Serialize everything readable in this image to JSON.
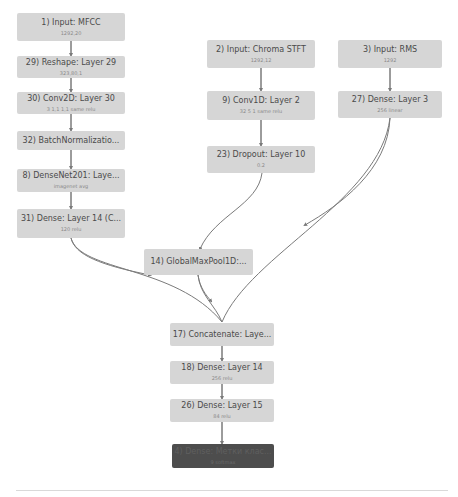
{
  "diagram": {
    "type": "neural-network-architecture",
    "nodes": [
      {
        "id": "n1",
        "title": "1) Input: MFCC",
        "sub": "1292,20"
      },
      {
        "id": "n29",
        "title": "29) Reshape: Layer 29",
        "sub": "323,80,1"
      },
      {
        "id": "n30",
        "title": "30) Conv2D: Layer 30",
        "sub": "3  1,1  1,1  same  relu"
      },
      {
        "id": "n32",
        "title": "32) BatchNormalizatio...",
        "sub": ""
      },
      {
        "id": "n8",
        "title": "8) DenseNet201: Laye...",
        "sub": "imagenet  avg"
      },
      {
        "id": "n31",
        "title": "31) Dense: Layer 14 (C...",
        "sub": "120  relu"
      },
      {
        "id": "n2",
        "title": "2) Input: Chroma STFT",
        "sub": "1292,12"
      },
      {
        "id": "n9",
        "title": "9) Conv1D: Layer 2",
        "sub": "32  5  1  same  relu"
      },
      {
        "id": "n23",
        "title": "23) Dropout: Layer 10",
        "sub": "0.2"
      },
      {
        "id": "n14",
        "title": "14) GlobalMaxPool1D:...",
        "sub": ""
      },
      {
        "id": "n3",
        "title": "3) Input: RMS",
        "sub": "1292"
      },
      {
        "id": "n27",
        "title": "27) Dense: Layer 3",
        "sub": "256  linear"
      },
      {
        "id": "n17",
        "title": "17) Concatenate: Laye...",
        "sub": ""
      },
      {
        "id": "n18",
        "title": "18) Dense: Layer 14",
        "sub": "256  relu"
      },
      {
        "id": "n26",
        "title": "26) Dense: Layer 15",
        "sub": "84  relu"
      },
      {
        "id": "n4",
        "title": "4) Dense: Метки клас...",
        "sub": "9  softmax"
      }
    ],
    "edges": [
      [
        "n1",
        "n29"
      ],
      [
        "n29",
        "n30"
      ],
      [
        "n30",
        "n32"
      ],
      [
        "n32",
        "n8"
      ],
      [
        "n8",
        "n31"
      ],
      [
        "n2",
        "n9"
      ],
      [
        "n9",
        "n23"
      ],
      [
        "n23",
        "n14"
      ],
      [
        "n3",
        "n27"
      ],
      [
        "n31",
        "n17"
      ],
      [
        "n14",
        "n17"
      ],
      [
        "n27",
        "n17"
      ],
      [
        "n17",
        "n18"
      ],
      [
        "n18",
        "n26"
      ],
      [
        "n26",
        "n4"
      ]
    ],
    "colors": {
      "node_fill": "#d6d6d6",
      "output_node_fill": "#4d4d4d",
      "edge": "#7a7a7a",
      "title_text": "#4a4a4a",
      "sub_text": "#8a8a8a"
    }
  }
}
